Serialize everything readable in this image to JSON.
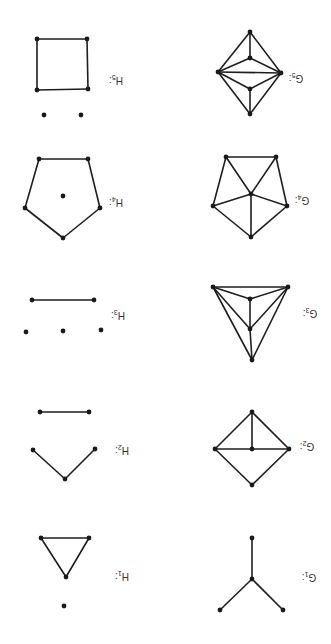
{
  "orientation": "rotated-180",
  "colors": {
    "ink": "#1e1e1e",
    "background": "#ffffff",
    "label": "#333333"
  },
  "graphs": [
    {
      "id": "G1",
      "label": "G",
      "sub": "1",
      "suffix": ":",
      "label_pos": [
        309,
        577
      ],
      "vertices": [
        [
          252,
          538
        ],
        [
          252,
          579
        ],
        [
          220,
          610
        ],
        [
          283,
          610
        ]
      ],
      "edges": [
        [
          0,
          1
        ],
        [
          1,
          2
        ],
        [
          1,
          3
        ]
      ]
    },
    {
      "id": "G2",
      "label": "G",
      "sub": "2",
      "suffix": ":",
      "label_pos": [
        307,
        446
      ],
      "vertices": [
        [
          252,
          412
        ],
        [
          215,
          449
        ],
        [
          252,
          449
        ],
        [
          289,
          449
        ],
        [
          252,
          485
        ]
      ],
      "edges": [
        [
          0,
          1
        ],
        [
          0,
          3
        ],
        [
          0,
          2
        ],
        [
          1,
          2
        ],
        [
          2,
          3
        ],
        [
          1,
          4
        ],
        [
          3,
          4
        ]
      ]
    },
    {
      "id": "G3",
      "label": "G",
      "sub": "3",
      "suffix": ":",
      "label_pos": [
        310,
        313
      ],
      "vertices": [
        [
          213,
          287
        ],
        [
          288,
          287
        ],
        [
          250,
          299
        ],
        [
          250,
          329
        ],
        [
          252,
          360
        ]
      ],
      "edges": [
        [
          0,
          1
        ],
        [
          0,
          2
        ],
        [
          1,
          2
        ],
        [
          2,
          3
        ],
        [
          0,
          3
        ],
        [
          1,
          3
        ],
        [
          3,
          4
        ],
        [
          0,
          4
        ],
        [
          1,
          4
        ]
      ]
    },
    {
      "id": "G4",
      "label": "G",
      "sub": "4",
      "suffix": ":",
      "label_pos": [
        302,
        200
      ],
      "vertices": [
        [
          226,
          157
        ],
        [
          276,
          157
        ],
        [
          213,
          206
        ],
        [
          287,
          206
        ],
        [
          251,
          237
        ],
        [
          251,
          194
        ]
      ],
      "edges": [
        [
          0,
          1
        ],
        [
          0,
          2
        ],
        [
          1,
          3
        ],
        [
          2,
          4
        ],
        [
          3,
          4
        ],
        [
          5,
          0
        ],
        [
          5,
          1
        ],
        [
          5,
          2
        ],
        [
          5,
          3
        ],
        [
          5,
          4
        ]
      ]
    },
    {
      "id": "G5",
      "label": "G",
      "sub": "5",
      "suffix": ":",
      "label_pos": [
        296,
        78
      ],
      "vertices": [
        [
          250,
          32
        ],
        [
          250,
          58
        ],
        [
          218,
          72
        ],
        [
          281,
          73
        ],
        [
          250,
          89
        ],
        [
          250,
          114
        ]
      ],
      "edges": [
        [
          0,
          2
        ],
        [
          0,
          3
        ],
        [
          0,
          1
        ],
        [
          1,
          2
        ],
        [
          1,
          3
        ],
        [
          2,
          3
        ],
        [
          2,
          4
        ],
        [
          3,
          4
        ],
        [
          4,
          5
        ],
        [
          2,
          5
        ],
        [
          3,
          5
        ]
      ]
    },
    {
      "id": "H1",
      "label": "H",
      "sub": "1",
      "suffix": ":",
      "label_pos": [
        122,
        576
      ],
      "vertices": [
        [
          41,
          538
        ],
        [
          89,
          538
        ],
        [
          66,
          577
        ],
        [
          64,
          606
        ]
      ],
      "edges": [
        [
          0,
          1
        ],
        [
          0,
          2
        ],
        [
          1,
          2
        ]
      ]
    },
    {
      "id": "H2",
      "label": "H",
      "sub": "2",
      "suffix": ":",
      "label_pos": [
        122,
        450
      ],
      "vertices": [
        [
          40,
          412
        ],
        [
          89,
          412
        ],
        [
          33,
          450
        ],
        [
          65,
          479
        ],
        [
          95,
          449
        ]
      ],
      "edges": [
        [
          0,
          1
        ],
        [
          2,
          3
        ],
        [
          3,
          4
        ]
      ]
    },
    {
      "id": "H3",
      "label": "H",
      "sub": "3",
      "suffix": ":",
      "label_pos": [
        118,
        315
      ],
      "vertices": [
        [
          32,
          300
        ],
        [
          94,
          300
        ],
        [
          26,
          332
        ],
        [
          63,
          331
        ],
        [
          101,
          330
        ]
      ],
      "edges": [
        [
          0,
          1
        ]
      ]
    },
    {
      "id": "H4",
      "label": "H",
      "sub": "4",
      "suffix": ":",
      "label_pos": [
        116,
        202
      ],
      "vertices": [
        [
          39,
          159
        ],
        [
          88,
          159
        ],
        [
          25,
          208
        ],
        [
          100,
          208
        ],
        [
          63,
          238
        ],
        [
          63,
          196
        ]
      ],
      "edges": [
        [
          0,
          1
        ],
        [
          0,
          2
        ],
        [
          1,
          3
        ],
        [
          2,
          4
        ],
        [
          3,
          4
        ]
      ]
    },
    {
      "id": "H5",
      "label": "H",
      "sub": "5",
      "suffix": ":",
      "label_pos": [
        116,
        80
      ],
      "vertices": [
        [
          37,
          39
        ],
        [
          87,
          39
        ],
        [
          37,
          90
        ],
        [
          88,
          89
        ],
        [
          44,
          115
        ],
        [
          81,
          115
        ]
      ],
      "edges": [
        [
          0,
          1
        ],
        [
          0,
          2
        ],
        [
          1,
          3
        ],
        [
          2,
          3
        ]
      ]
    }
  ]
}
